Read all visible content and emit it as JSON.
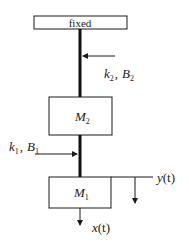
{
  "diagram": {
    "type": "mechanical-mass-spring-damper",
    "support": {
      "label": "fixed"
    },
    "masses": [
      {
        "id": "M2",
        "symbol": "M",
        "subscript": "2"
      },
      {
        "id": "M1",
        "symbol": "M",
        "subscript": "1"
      }
    ],
    "couplings": [
      {
        "id": "upper",
        "k": "k",
        "k_sub": "2",
        "sep": ",",
        "B": "B",
        "B_sub": "2"
      },
      {
        "id": "lower",
        "k": "k",
        "k_sub": "1",
        "sep": ",",
        "B": "B",
        "B_sub": "1"
      }
    ],
    "signals": [
      {
        "id": "x",
        "name": "x",
        "arg": "(t)"
      },
      {
        "id": "y",
        "name": "y",
        "arg": "(t)"
      }
    ],
    "colors": {
      "line": "#1a1a1a",
      "rod": "#111111",
      "background": "#ffffff"
    }
  }
}
